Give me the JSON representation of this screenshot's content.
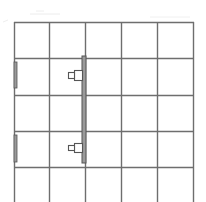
{
  "diagram": {
    "type": "floor-plan-grid",
    "colors": {
      "background": "#ffffff",
      "grid_line": "#6e6e6e",
      "wall_bar_fill": "#9a9a9a",
      "wall_bar_stroke": "#555555",
      "device_stroke": "#555555",
      "faint_mark": "#e4e4e4"
    },
    "grid": {
      "columns": 5,
      "visible_rows": 5,
      "x_lines": [
        14,
        49,
        85,
        121,
        157,
        193
      ],
      "y_lines": [
        22,
        58,
        95,
        131,
        167
      ],
      "bottom_edge": 202
    },
    "central_bar": {
      "x": 82,
      "y": 56,
      "width": 4,
      "height": 107
    },
    "left_bars": [
      {
        "x": 14,
        "y": 62,
        "width": 3,
        "height": 26
      },
      {
        "x": 14,
        "y": 135,
        "width": 3,
        "height": 27
      }
    ],
    "devices": [
      {
        "body": {
          "x": 74,
          "y": 70,
          "width": 8,
          "height": 10
        },
        "tip": {
          "x": 68,
          "y": 72,
          "width": 6,
          "height": 6
        }
      },
      {
        "body": {
          "x": 74,
          "y": 143,
          "width": 8,
          "height": 9
        },
        "tip": {
          "x": 68,
          "y": 145,
          "width": 6,
          "height": 5
        }
      }
    ]
  }
}
